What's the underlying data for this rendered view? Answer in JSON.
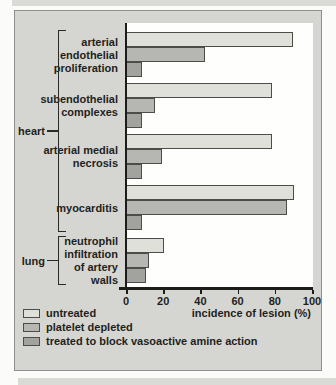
{
  "chart_data": {
    "type": "bar",
    "orientation": "horizontal",
    "xlabel": "incidence of lesion (%)",
    "x_ticks": [
      0,
      20,
      40,
      60,
      80,
      100
    ],
    "xlim": [
      0,
      100
    ],
    "grid": false,
    "legend_position": "bottom-left",
    "series": [
      {
        "name": "untreated",
        "color": "#dfe0da"
      },
      {
        "name": "platelet depleted",
        "color": "#b6b7b2"
      },
      {
        "name": "treated to block vasoactive amine action",
        "color": "#a2a39e"
      }
    ],
    "groups": [
      {
        "organ": "heart",
        "label": "arterial endothelial proliferation",
        "label_lines": [
          "arterial",
          "endothelial",
          "proliferation"
        ],
        "values": [
          89,
          42,
          8
        ]
      },
      {
        "organ": "heart",
        "label": "subendothelial complexes",
        "label_lines": [
          "subendothelial",
          "complexes"
        ],
        "values": [
          78,
          15,
          8
        ]
      },
      {
        "organ": "heart",
        "label": "arterial medial necrosis",
        "label_lines": [
          "arterial medial",
          "necrosis"
        ],
        "values": [
          78,
          19,
          8
        ]
      },
      {
        "organ": "heart",
        "label": "myocarditis",
        "label_lines": [
          "myocarditis"
        ],
        "values": [
          90,
          86,
          8
        ]
      },
      {
        "organ": "lung",
        "label": "neutrophil infiltration of artery walls",
        "label_lines": [
          "neutrophil",
          "infiltration",
          "of artery",
          "walls"
        ],
        "values": [
          20,
          12,
          10
        ]
      }
    ],
    "organ_groups": [
      {
        "label": "heart",
        "from": 0,
        "to": 3
      },
      {
        "label": "lung",
        "from": 4,
        "to": 4
      }
    ]
  }
}
